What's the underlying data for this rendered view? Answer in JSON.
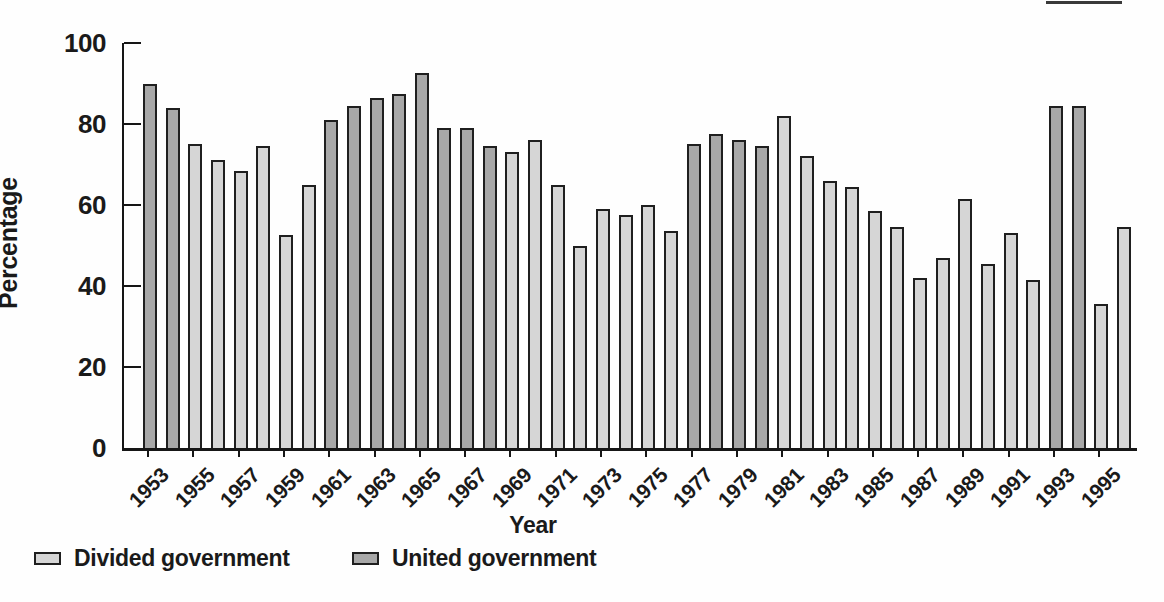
{
  "figure": {
    "ylabel": "Percentage",
    "xlabel": "Year"
  },
  "legend": {
    "items": [
      {
        "key": "divided",
        "label": "Divided government",
        "color": "#d6d6d6"
      },
      {
        "key": "united",
        "label": "United government",
        "color": "#a8a8a8"
      }
    ]
  },
  "colors": {
    "divided": "#d6d6d6",
    "united": "#a8a8a8",
    "bar_border": "#1f1f1f",
    "axis": "#161616"
  },
  "chart_data": {
    "type": "bar",
    "title": "",
    "xlabel": "Year",
    "ylabel": "Percentage",
    "ylim": [
      0,
      100
    ],
    "yticks": [
      0,
      20,
      40,
      60,
      80,
      100
    ],
    "xtick_labels": [
      "1953",
      "1955",
      "1957",
      "1959",
      "1961",
      "1963",
      "1965",
      "1967",
      "1969",
      "1971",
      "1973",
      "1975",
      "1977",
      "1979",
      "1981",
      "1983",
      "1985",
      "1987",
      "1989",
      "1991",
      "1993",
      "1995"
    ],
    "grid": false,
    "legend_position": "bottom-left",
    "series_names": [
      "Divided government",
      "United government"
    ],
    "bars": [
      {
        "year": 1953,
        "value": 90,
        "government": "united"
      },
      {
        "year": 1954,
        "value": 84,
        "government": "united"
      },
      {
        "year": 1955,
        "value": 75,
        "government": "divided"
      },
      {
        "year": 1956,
        "value": 71,
        "government": "divided"
      },
      {
        "year": 1957,
        "value": 68.5,
        "government": "divided"
      },
      {
        "year": 1958,
        "value": 74.5,
        "government": "divided"
      },
      {
        "year": 1959,
        "value": 52.5,
        "government": "divided"
      },
      {
        "year": 1960,
        "value": 65,
        "government": "divided"
      },
      {
        "year": 1961,
        "value": 81,
        "government": "united"
      },
      {
        "year": 1962,
        "value": 84.5,
        "government": "united"
      },
      {
        "year": 1963,
        "value": 86.5,
        "government": "united"
      },
      {
        "year": 1964,
        "value": 87.5,
        "government": "united"
      },
      {
        "year": 1965,
        "value": 92.5,
        "government": "united"
      },
      {
        "year": 1966,
        "value": 79,
        "government": "united"
      },
      {
        "year": 1967,
        "value": 79,
        "government": "united"
      },
      {
        "year": 1968,
        "value": 74.5,
        "government": "united"
      },
      {
        "year": 1969,
        "value": 73,
        "government": "divided"
      },
      {
        "year": 1970,
        "value": 76,
        "government": "divided"
      },
      {
        "year": 1971,
        "value": 65,
        "government": "divided"
      },
      {
        "year": 1972,
        "value": 50,
        "government": "divided"
      },
      {
        "year": 1973,
        "value": 59,
        "government": "divided"
      },
      {
        "year": 1974,
        "value": 57.5,
        "government": "divided"
      },
      {
        "year": 1975,
        "value": 60,
        "government": "divided"
      },
      {
        "year": 1976,
        "value": 53.5,
        "government": "divided"
      },
      {
        "year": 1977,
        "value": 75,
        "government": "united"
      },
      {
        "year": 1978,
        "value": 77.5,
        "government": "united"
      },
      {
        "year": 1979,
        "value": 76,
        "government": "united"
      },
      {
        "year": 1980,
        "value": 74.5,
        "government": "united"
      },
      {
        "year": 1981,
        "value": 82,
        "government": "divided"
      },
      {
        "year": 1982,
        "value": 72,
        "government": "divided"
      },
      {
        "year": 1983,
        "value": 66,
        "government": "divided"
      },
      {
        "year": 1984,
        "value": 64.5,
        "government": "divided"
      },
      {
        "year": 1985,
        "value": 58.5,
        "government": "divided"
      },
      {
        "year": 1986,
        "value": 54.5,
        "government": "divided"
      },
      {
        "year": 1987,
        "value": 42,
        "government": "divided"
      },
      {
        "year": 1988,
        "value": 47,
        "government": "divided"
      },
      {
        "year": 1989,
        "value": 61.5,
        "government": "divided"
      },
      {
        "year": 1990,
        "value": 45.5,
        "government": "divided"
      },
      {
        "year": 1991,
        "value": 53,
        "government": "divided"
      },
      {
        "year": 1992,
        "value": 41.5,
        "government": "divided"
      },
      {
        "year": 1993,
        "value": 84.5,
        "government": "united"
      },
      {
        "year": 1994,
        "value": 84.5,
        "government": "united"
      },
      {
        "year": 1995,
        "value": 35.5,
        "government": "divided"
      },
      {
        "year": 1996,
        "value": 54.5,
        "government": "divided"
      }
    ]
  }
}
